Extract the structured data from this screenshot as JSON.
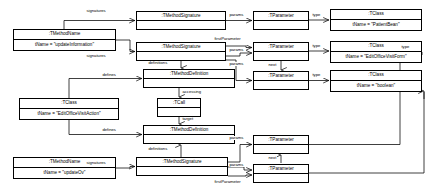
{
  "diagram": {
    "kind": "uml-object-diagram",
    "background": "#ffffff",
    "stroke": "#000000",
    "width": 430,
    "height": 192,
    "nodes": [
      {
        "id": "mn1",
        "type": ":TMethodName",
        "attr": "tName = \"updateInformation\"",
        "x": 13,
        "y": 29,
        "w": 103,
        "h": 22,
        "rows": [
          "title",
          "attr"
        ]
      },
      {
        "id": "ms1",
        "type": ":TMethodSignature",
        "attr": "",
        "x": 136,
        "y": 11,
        "w": 90,
        "h": 19,
        "rows": [
          "title",
          "blank"
        ]
      },
      {
        "id": "ms2",
        "type": ":TMethodSignature",
        "attr": "",
        "x": 136,
        "y": 42,
        "w": 90,
        "h": 19,
        "rows": [
          "title",
          "blank"
        ]
      },
      {
        "id": "md1",
        "type": ":TMethodDefinition",
        "attr": "",
        "x": 143,
        "y": 69,
        "w": 92,
        "h": 19,
        "rows": [
          "title",
          "blank"
        ]
      },
      {
        "id": "call1",
        "type": ":TCall",
        "attr": "",
        "x": 157,
        "y": 98,
        "w": 44,
        "h": 19,
        "rows": [
          "title",
          "blank"
        ]
      },
      {
        "id": "cls4",
        "type": ":TClass",
        "attr": "tName = \"EditOfficeVisitAction\"",
        "x": 19,
        "y": 98,
        "w": 100,
        "h": 22,
        "rows": [
          "title",
          "attr"
        ]
      },
      {
        "id": "md2",
        "type": ":TMethodDefinition",
        "attr": "",
        "x": 143,
        "y": 125,
        "w": 92,
        "h": 19,
        "rows": [
          "title",
          "blank"
        ]
      },
      {
        "id": "mn2",
        "type": ":TMethodName",
        "attr": "tName = \"updateOv\"",
        "x": 13,
        "y": 157,
        "w": 103,
        "h": 22,
        "rows": [
          "title",
          "attr"
        ]
      },
      {
        "id": "ms3",
        "type": ":TMethodSignature",
        "attr": "",
        "x": 136,
        "y": 157,
        "w": 92,
        "h": 19,
        "rows": [
          "title",
          "blank"
        ]
      },
      {
        "id": "p1",
        "type": ":TParameter",
        "attr": "",
        "x": 253,
        "y": 11,
        "w": 56,
        "h": 19,
        "rows": [
          "title",
          "blank"
        ]
      },
      {
        "id": "p2",
        "type": ":TParameter",
        "attr": "",
        "x": 253,
        "y": 42,
        "w": 56,
        "h": 19,
        "rows": [
          "title",
          "blank"
        ]
      },
      {
        "id": "p3",
        "type": ":TParameter",
        "attr": "",
        "x": 253,
        "y": 71,
        "w": 56,
        "h": 19,
        "rows": [
          "title",
          "blank"
        ]
      },
      {
        "id": "p4",
        "type": ":TParameter",
        "attr": "",
        "x": 253,
        "y": 135,
        "w": 56,
        "h": 19,
        "rows": [
          "title",
          "blank"
        ]
      },
      {
        "id": "p5",
        "type": ":TParameter",
        "attr": "",
        "x": 253,
        "y": 164,
        "w": 56,
        "h": 19,
        "rows": [
          "title",
          "blank"
        ]
      },
      {
        "id": "cls1",
        "type": ":TClass",
        "attr": "tName = \"PatientBean\"",
        "x": 330,
        "y": 9,
        "w": 92,
        "h": 22,
        "rows": [
          "title",
          "attr"
        ]
      },
      {
        "id": "cls2",
        "type": ":TClass",
        "attr": "tName = \"EditOfficeVisitForm\"",
        "x": 330,
        "y": 41,
        "w": 92,
        "h": 22,
        "rows": [
          "title",
          "attr"
        ]
      },
      {
        "id": "cls3",
        "type": ":TClass",
        "attr": "tName = \"boolean\"",
        "x": 330,
        "y": 70,
        "w": 92,
        "h": 22,
        "rows": [
          "title",
          "attr"
        ]
      }
    ],
    "edge_labels": [
      {
        "id": "el1",
        "text": "signatures",
        "x": 86,
        "y": 9
      },
      {
        "id": "el2",
        "text": "signatures",
        "x": 86,
        "y": 54
      },
      {
        "id": "el3",
        "text": "params",
        "x": 229,
        "y": 17
      },
      {
        "id": "el4",
        "text": "type",
        "x": 313,
        "y": 10
      },
      {
        "id": "el5",
        "text": "firstParameter",
        "x": 216,
        "y": 36
      },
      {
        "id": "el6",
        "text": "params",
        "x": 229,
        "y": 47
      },
      {
        "id": "el7",
        "text": "type",
        "x": 313,
        "y": 41
      },
      {
        "id": "el8",
        "text": "next",
        "x": 268,
        "y": 64
      },
      {
        "id": "el9",
        "text": "params",
        "x": 229,
        "y": 66
      },
      {
        "id": "el10",
        "text": "type",
        "x": 313,
        "y": 70
      },
      {
        "id": "el11",
        "text": "type",
        "x": 403,
        "y": 46
      },
      {
        "id": "el12",
        "text": "definitions",
        "x": 148,
        "y": 62
      },
      {
        "id": "el13",
        "text": "defines",
        "x": 104,
        "y": 65
      },
      {
        "id": "el14",
        "text": "accessing",
        "x": 178,
        "y": 91
      },
      {
        "id": "el15",
        "text": "target",
        "x": 178,
        "y": 119
      },
      {
        "id": "el16",
        "text": "defines",
        "x": 104,
        "y": 121
      },
      {
        "id": "el17",
        "text": "definitions",
        "x": 148,
        "y": 149
      },
      {
        "id": "el18",
        "text": "signatures",
        "x": 86,
        "y": 160
      },
      {
        "id": "el19",
        "text": "params",
        "x": 229,
        "y": 133
      },
      {
        "id": "el20",
        "text": "next",
        "x": 268,
        "y": 157
      },
      {
        "id": "el21",
        "text": "params",
        "x": 229,
        "y": 162
      },
      {
        "id": "el22",
        "text": "firstParameter",
        "x": 216,
        "y": 181
      }
    ]
  }
}
